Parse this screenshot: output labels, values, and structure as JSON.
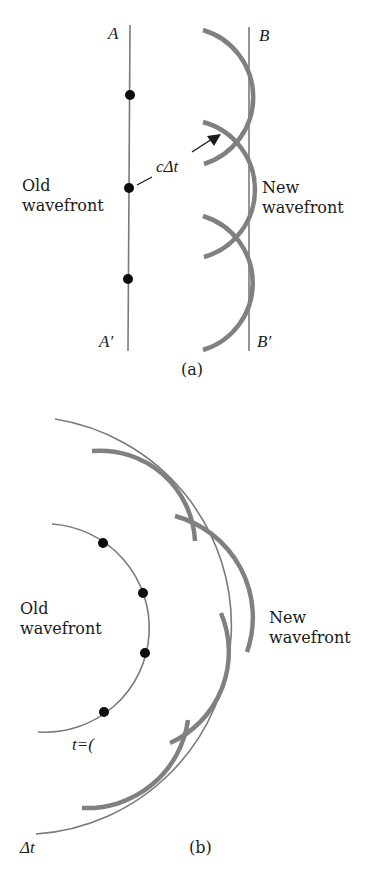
{
  "panel_a": {
    "caption": "(a)",
    "label_top_left": "A",
    "label_bottom_left": "A′",
    "label_top_right": "B",
    "label_bottom_right": "B′",
    "old_wavefront": [
      "Old",
      "wavefront"
    ],
    "new_wavefront": [
      "New",
      "wavefront"
    ],
    "arrow_label": "cΔt"
  },
  "panel_b": {
    "caption": "(b)",
    "old_wavefront": [
      "Old",
      "wavefront"
    ],
    "new_wavefront": [
      "New",
      "wavefront"
    ],
    "inner_time_label": "t=(",
    "outer_time_label": "Δt"
  },
  "colors": {
    "line": "#7a7a7a",
    "wavelet": "#808080",
    "dot": "#0d0d0d",
    "text": "#1a1a1a"
  }
}
